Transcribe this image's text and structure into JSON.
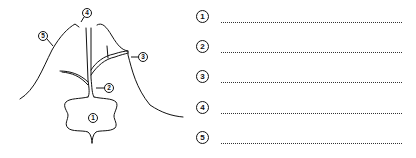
{
  "diagram": {
    "callouts": [
      {
        "id": "1",
        "label": "1"
      },
      {
        "id": "2",
        "label": "2"
      },
      {
        "id": "3",
        "label": "3"
      },
      {
        "id": "4",
        "label": "4"
      },
      {
        "id": "5",
        "label": "5"
      }
    ]
  },
  "answers": [
    {
      "number": "1",
      "value": ""
    },
    {
      "number": "2",
      "value": ""
    },
    {
      "number": "3",
      "value": ""
    },
    {
      "number": "4",
      "value": ""
    },
    {
      "number": "5",
      "value": ""
    }
  ]
}
